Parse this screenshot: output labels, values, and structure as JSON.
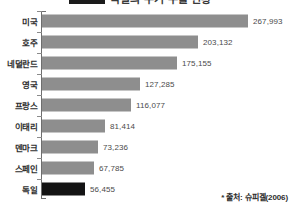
{
  "legend": {
    "title": "독일의 무기 수출 현황",
    "swatch_color": "#1b1b1b"
  },
  "source_note": "* 출처: 슈피겔(2006)",
  "colors": {
    "bar": "#8e8e8e",
    "bar_highlight": "#141414",
    "axis": "#6e6e6e",
    "value_text": "#4a4a4a",
    "label_text": "#2e2e2e",
    "background": "#ffffff"
  },
  "chart_data": {
    "type": "bar",
    "orientation": "horizontal",
    "title": "독일의 무기 수출 현황",
    "xlabel": "",
    "ylabel": "",
    "grid": false,
    "legend_position": "top",
    "xlim": [
      0,
      267993
    ],
    "categories": [
      "미국",
      "호주",
      "네덜란드",
      "영국",
      "프랑스",
      "이태리",
      "덴마크",
      "스페인",
      "독일"
    ],
    "values": [
      267993,
      203132,
      175155,
      127285,
      116077,
      81414,
      73236,
      67785,
      56455
    ],
    "value_labels": [
      "267,993",
      "203,132",
      "175,155",
      "127,285",
      "116,077",
      "81,414",
      "73,236",
      "67,785",
      "56,455"
    ],
    "highlight_index": 8,
    "source": "* 출처: 슈피겔(2006)"
  }
}
